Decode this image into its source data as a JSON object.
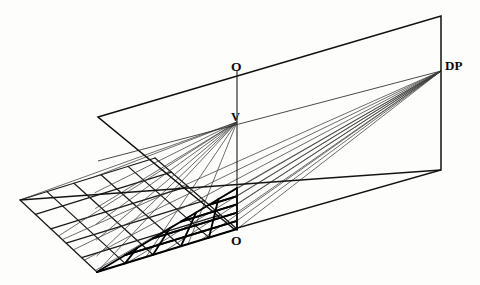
{
  "figure": {
    "background_color": "#fdfdfc",
    "ink_color": "#111111",
    "thin_ink_color": "#4a4a4a"
  },
  "labels": {
    "o_top": "O",
    "o_bottom": "O",
    "v": "V",
    "dp": "DP"
  },
  "points": {
    "V": {
      "x": 237,
      "y": 122,
      "name": "vanishing-point"
    },
    "DP": {
      "x": 441,
      "y": 71,
      "name": "distance-point"
    },
    "O_top": {
      "x": 237,
      "y": 66,
      "name": "center-of-vision-upper"
    },
    "O_bottom": {
      "x": 237,
      "y": 229,
      "name": "station-origin-lower"
    },
    "grid_apex": {
      "x": 97,
      "y": 272,
      "name": "near-grid-corner"
    }
  },
  "picture_plane": {
    "name": "picture-plane-rectangle",
    "points": [
      {
        "x": 98,
        "y": 117
      },
      {
        "x": 441,
        "y": 16
      },
      {
        "x": 441,
        "y": 170
      },
      {
        "x": 234,
        "y": 229
      }
    ],
    "stroke_width": 1.5
  },
  "vertical_axis": {
    "name": "vertical-axis-O-to-O",
    "x": 237,
    "y_top": 70,
    "y_bottom": 231
  },
  "horizon_line": {
    "name": "horizon-line",
    "from": {
      "x": 98,
      "y": 161
    },
    "to": {
      "x": 441,
      "y": 71
    }
  },
  "ground_line": {
    "name": "ground-line",
    "from": {
      "x": 20,
      "y": 200
    },
    "to": {
      "x": 441,
      "y": 170
    }
  },
  "ortho_grid": {
    "name": "orthogonal-ground-grid",
    "description": "true-shape square grid drawn in oblique projection on the ground plane",
    "corner_left": {
      "x": 20,
      "y": 200
    },
    "corner_far": {
      "x": 155,
      "y": 158
    },
    "corner_right": {
      "x": 237,
      "y": 229
    },
    "corner_near": {
      "x": 97,
      "y": 272
    },
    "divisions_u": 5,
    "divisions_v": 5,
    "stroke_width": 1.3
  },
  "perspective_grid": {
    "name": "perspective-foreshortened-grid",
    "description": "bold foreshortened grid formed by rays to V crossed with rays to DP",
    "corner_far": {
      "x": 237,
      "y": 188
    },
    "corner_right": {
      "x": 237,
      "y": 229
    },
    "corner_near": {
      "x": 97,
      "y": 272
    },
    "divisions": 5,
    "stroke_width": 1.9
  },
  "ray_bundles": [
    {
      "name": "rays-to-vanishing-point",
      "apex": {
        "x": 237,
        "y": 122
      },
      "count": 6,
      "stroke_width": 0.8
    },
    {
      "name": "rays-to-distance-point",
      "apex": {
        "x": 441,
        "y": 71
      },
      "count": 7,
      "stroke_width": 0.8
    }
  ]
}
